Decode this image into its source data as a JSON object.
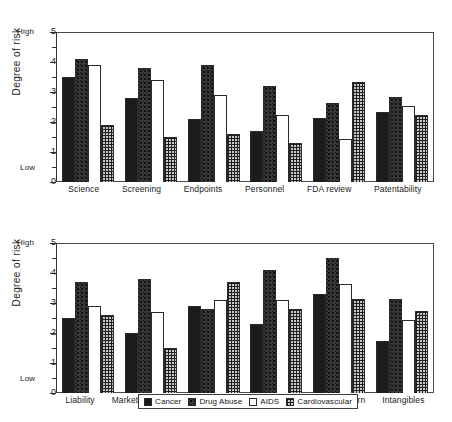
{
  "chart_data": [
    {
      "type": "bar",
      "id": "top-panel",
      "title": "",
      "xlabel": "",
      "ylabel": "Degree of risk",
      "ylim": [
        0,
        5
      ],
      "yticks": [
        0,
        1,
        2,
        3,
        4,
        5
      ],
      "ytick_labels": [
        "0",
        "1",
        "2",
        "3",
        "4",
        "5"
      ],
      "minor_tick_step": 0.5,
      "grid": false,
      "axis_high_label": "High",
      "axis_low_label": "Low",
      "legend_position": "bottom",
      "categories": [
        "Science",
        "Screening",
        "Endpoints",
        "Personnel",
        "FDA review",
        "Patentability"
      ],
      "series": [
        {
          "name": "Cancer",
          "values": [
            3.5,
            2.8,
            2.1,
            1.7,
            2.15,
            2.35
          ]
        },
        {
          "name": "Drug Abuse",
          "values": [
            4.1,
            3.8,
            3.9,
            3.2,
            2.65,
            2.85
          ]
        },
        {
          "name": "AIDS",
          "values": [
            3.9,
            3.4,
            2.9,
            2.25,
            1.45,
            2.55
          ]
        },
        {
          "name": "Cardiovascular",
          "values": [
            1.9,
            1.5,
            1.6,
            1.3,
            3.35,
            2.25
          ]
        }
      ]
    },
    {
      "type": "bar",
      "id": "bottom-panel",
      "title": "",
      "xlabel": "",
      "ylabel": "Degree of risk",
      "ylim": [
        0,
        5
      ],
      "yticks": [
        0,
        1,
        2,
        3,
        4,
        5
      ],
      "ytick_labels": [
        "0",
        "1",
        "2",
        "3",
        "4",
        "5"
      ],
      "minor_tick_step": 0.5,
      "grid": false,
      "axis_high_label": "High",
      "axis_low_label": "Low",
      "legend_position": "bottom",
      "categories": [
        "Liability",
        "Market size",
        "Competitive",
        "Reimbursement",
        "Invest. return",
        "Intangibles"
      ],
      "series": [
        {
          "name": "Cancer",
          "values": [
            2.5,
            2.0,
            2.9,
            2.3,
            3.3,
            1.75
          ]
        },
        {
          "name": "Drug Abuse",
          "values": [
            3.7,
            3.8,
            2.8,
            4.1,
            4.5,
            3.15
          ]
        },
        {
          "name": "AIDS",
          "values": [
            2.9,
            2.7,
            3.1,
            3.1,
            3.65,
            2.45
          ]
        },
        {
          "name": "Cardiovascular",
          "values": [
            2.6,
            1.5,
            3.7,
            2.8,
            3.15,
            2.75
          ]
        }
      ]
    }
  ],
  "legend": {
    "items": [
      {
        "label": "Cancer",
        "swatch": "solid-black-swatch"
      },
      {
        "label": "Drug Abuse",
        "swatch": "dark-stipple-swatch"
      },
      {
        "label": "AIDS",
        "swatch": "open-white-swatch"
      },
      {
        "label": "Cardiovascular",
        "swatch": "crosshatch-swatch"
      }
    ]
  },
  "colors": {
    "series_cancer": "#1c1c1c",
    "series_drug_abuse": "#3a3a3a",
    "series_aids": "#ffffff",
    "series_cardiovascular": "#c9c9c9",
    "axis": "#333333",
    "frame": "#4a4a4a",
    "background": "#ffffff"
  }
}
